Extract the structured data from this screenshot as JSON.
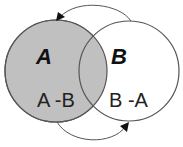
{
  "diagram": {
    "type": "venn",
    "sets": [
      {
        "id": "A",
        "label": "A",
        "region_label": "A -B",
        "fill": "#c0c0c0",
        "highlighted": true
      },
      {
        "id": "B",
        "label": "B",
        "region_label": "B -A",
        "fill": "#ffffff",
        "highlighted": false
      }
    ],
    "colors": {
      "shaded": "#c0c0c0",
      "outline": "#555555",
      "arrow": "#555555",
      "text": "#111111"
    },
    "arrows": [
      {
        "from": "B",
        "to": "A",
        "position": "top"
      },
      {
        "from": "A",
        "to": "B",
        "position": "bottom"
      }
    ]
  }
}
